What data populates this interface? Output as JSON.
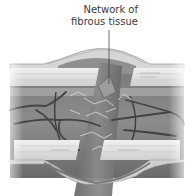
{
  "illustration": {
    "subject": "healing tissue with fibrous network bridging a wound",
    "label": {
      "line1": "Network of",
      "line2": "fibrous tissue"
    },
    "colors": {
      "background": "#ffffff",
      "skin_surface": "#d9d9d9",
      "tissue_dark": "#6e6e6e",
      "tissue_mid": "#8a8a8a",
      "band_light": "#e6e6e6",
      "vessel": "#444444",
      "fibre": "#d8d8d8",
      "text": "#3a3a3a"
    }
  }
}
